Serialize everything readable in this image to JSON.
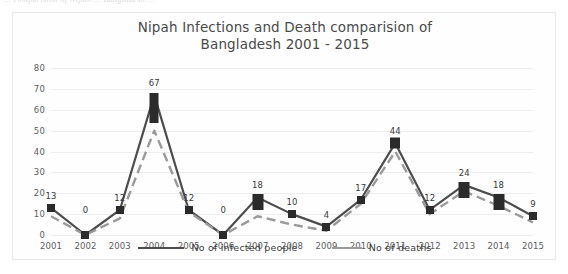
{
  "page": {
    "scan_artifact_text": "... comparision of Nipah ... Bangladesh ..."
  },
  "chart_data": {
    "type": "line",
    "title": "Nipah Infections and Death comparision of Bangladesh 2001 - 2015",
    "title_lines": [
      "Nipah Infections and Death comparision of",
      "Bangladesh 2001 - 2015"
    ],
    "xlabel": "",
    "ylabel": "",
    "ylim": [
      0,
      80
    ],
    "ytick_step": 10,
    "yticks": [
      "80",
      "70",
      "60",
      "50",
      "40",
      "30",
      "20",
      "10",
      "0"
    ],
    "grid": true,
    "legend_position": "bottom",
    "categories": [
      "2001",
      "2002",
      "2003",
      "2004",
      "2005",
      "2006",
      "2007",
      "2008",
      "2009",
      "2010",
      "2011",
      "2012",
      "2013",
      "2014",
      "2015"
    ],
    "series": [
      {
        "name": "No of infected people",
        "color": "#4d4d4d",
        "style": "solid",
        "marker": "square",
        "values": [
          13,
          0,
          12,
          67,
          12,
          0,
          18,
          10,
          4,
          17,
          44,
          12,
          24,
          18,
          9
        ],
        "labels": [
          "13",
          "0",
          "12",
          "67",
          "12",
          "0",
          "18",
          "10",
          "4",
          "17",
          "44",
          "12",
          "24",
          "18",
          "9"
        ]
      },
      {
        "name": "No of deaths",
        "color": "#9a9a9a",
        "style": "dashed",
        "marker": "none",
        "values": [
          9,
          0,
          8,
          50,
          11,
          0,
          9,
          5,
          2,
          15,
          40,
          10,
          21,
          14,
          6
        ],
        "labels": []
      }
    ]
  },
  "legend": {
    "items": [
      {
        "label": "No of infected people"
      },
      {
        "label": "No of deaths"
      }
    ]
  }
}
